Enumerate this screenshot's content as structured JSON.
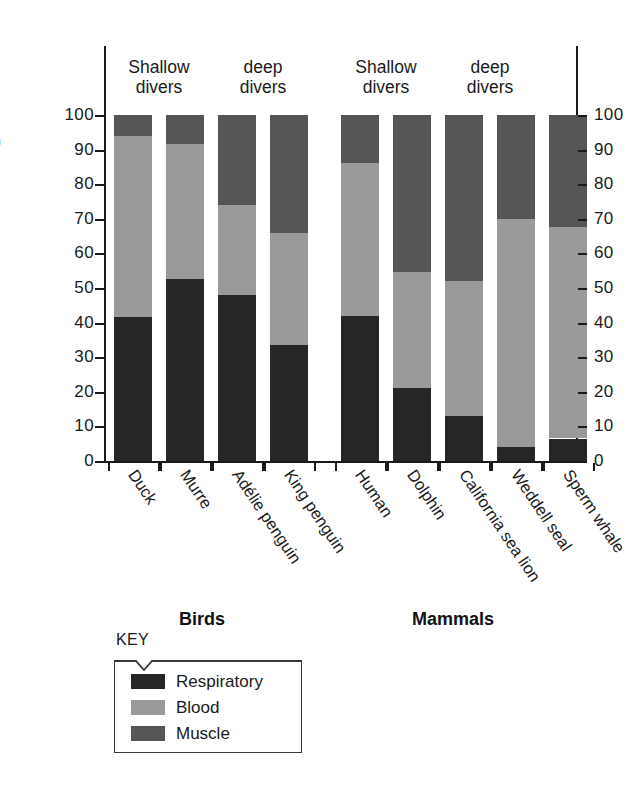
{
  "chart_data": {
    "type": "bar",
    "subtype": "stacked-bar",
    "title": "",
    "xlabel": "",
    "ylabel": "% Total O2 store",
    "ylabel_display": "% Total O₂ store",
    "ylim": [
      0,
      100
    ],
    "ytick_labels": [
      "100",
      "90",
      "80",
      "70",
      "60",
      "50",
      "40",
      "30",
      "20",
      "10",
      "0"
    ],
    "yticks": [
      100,
      90,
      80,
      70,
      60,
      50,
      40,
      30,
      20,
      10,
      0
    ],
    "grid": false,
    "dual_axis": true,
    "legend_position": "bottom-left",
    "legend_title": "KEY",
    "categories": [
      "Duck",
      "Murre",
      "Adélie penguin",
      "King penguin",
      "Human",
      "Dolphin",
      "California sea lion",
      "Weddell seal",
      "Sperm whale"
    ],
    "series": [
      {
        "name": "Respiratory",
        "color": "#262626",
        "values": [
          41.5,
          52.5,
          48.0,
          33.5,
          42.0,
          21.0,
          13.0,
          4.0,
          6.5
        ]
      },
      {
        "name": "Blood",
        "color": "#9a9a9a",
        "values": [
          52.5,
          39.0,
          26.0,
          32.5,
          44.0,
          33.5,
          39.0,
          66.0,
          61.0
        ]
      },
      {
        "name": "Muscle",
        "color": "#555555",
        "values": [
          6.0,
          8.5,
          26.0,
          34.0,
          14.0,
          45.5,
          48.0,
          30.0,
          32.5
        ]
      }
    ],
    "cumulative_tops": {
      "respiratory": [
        41.5,
        52.5,
        48.0,
        33.5,
        42.0,
        21.0,
        13.0,
        4.0,
        6.5
      ],
      "blood": [
        94.0,
        91.5,
        74.0,
        66.0,
        86.0,
        54.5,
        52.0,
        70.0,
        67.5
      ],
      "muscle": [
        100,
        100,
        100,
        100,
        100,
        100,
        100,
        100,
        100
      ]
    },
    "groups": [
      {
        "name": "Birds",
        "subgroups": [
          {
            "label": "Shallow\ndivers",
            "members": [
              "Duck",
              "Murre"
            ]
          },
          {
            "label": "deep\ndivers",
            "members": [
              "Adélie penguin",
              "King penguin"
            ]
          }
        ]
      },
      {
        "name": "Mammals",
        "subgroups": [
          {
            "label": "Shallow\ndivers",
            "members": [
              "Human",
              "Dolphin"
            ]
          },
          {
            "label": "deep\ndivers",
            "members": [
              "California sea lion",
              "Weddell seal",
              "Sperm whale"
            ]
          }
        ]
      }
    ],
    "annotations": [
      "Shallow divers",
      "deep divers",
      "Shallow divers",
      "deep divers",
      "Birds",
      "Mammals"
    ]
  },
  "axis": {
    "left_ticks": [
      "100",
      "90",
      "80",
      "70",
      "60",
      "50",
      "40",
      "30",
      "20",
      "10",
      "0"
    ],
    "right_ticks": [
      "100",
      "90",
      "80",
      "70",
      "60",
      "50",
      "40",
      "30",
      "20",
      "10",
      "0"
    ],
    "y_title": "% Total O₂ store"
  },
  "headers": {
    "birds_shallow": "Shallow\ndivers",
    "birds_deep": "deep\ndivers",
    "mammals_shallow": "Shallow\ndivers",
    "mammals_deep": "deep\ndivers"
  },
  "group_titles": {
    "birds": "Birds",
    "mammals": "Mammals"
  },
  "legend": {
    "title": "KEY",
    "items": [
      {
        "label": "Respiratory",
        "color": "#262626"
      },
      {
        "label": "Blood",
        "color": "#9a9a9a"
      },
      {
        "label": "Muscle",
        "color": "#555555"
      }
    ]
  },
  "xlabels": [
    "Duck",
    "Murre",
    "Adélie penguin",
    "King penguin",
    "Human",
    "Dolphin",
    "California sea lion",
    "Weddell seal",
    "Sperm whale"
  ]
}
